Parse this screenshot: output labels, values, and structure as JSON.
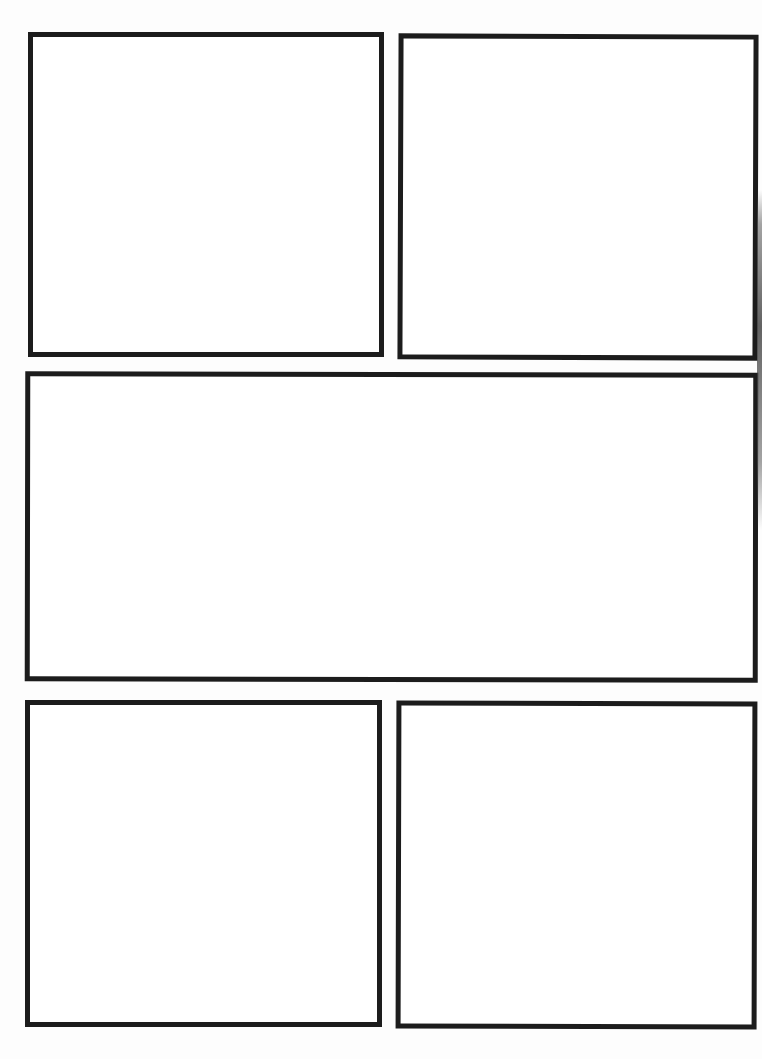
{
  "page": {
    "type": "blank comic page template",
    "background_color": "#ffffff",
    "border_color": "#1c1c1c",
    "panel_count": 5
  },
  "panels": [
    {
      "id": "panel-1",
      "row": 1,
      "position": "top-left",
      "content": ""
    },
    {
      "id": "panel-2",
      "row": 1,
      "position": "top-right",
      "content": ""
    },
    {
      "id": "panel-3",
      "row": 2,
      "position": "middle-wide",
      "content": ""
    },
    {
      "id": "panel-4",
      "row": 3,
      "position": "bottom-left",
      "content": ""
    },
    {
      "id": "panel-5",
      "row": 3,
      "position": "bottom-right",
      "content": ""
    }
  ]
}
